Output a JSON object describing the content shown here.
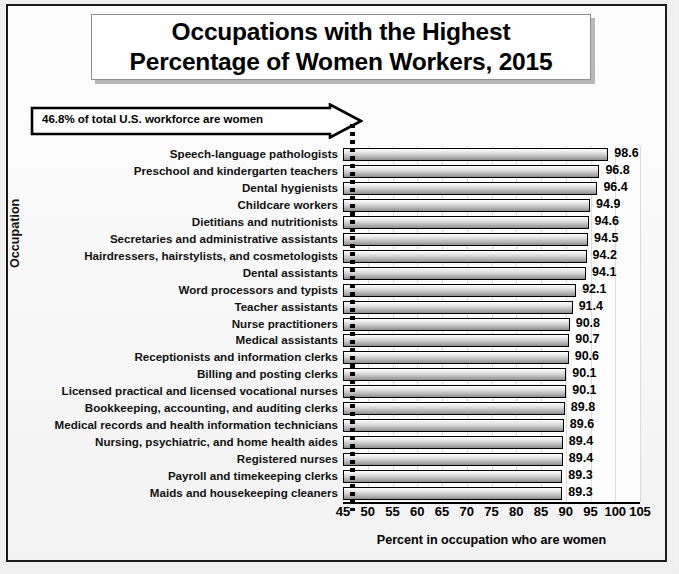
{
  "chart_data": {
    "type": "bar",
    "orientation": "horizontal",
    "title": "Occupations with the Highest Percentage of Women Workers, 2015",
    "title_lines": [
      "Occupations with the Highest",
      "Percentage of Women Workers, 2015"
    ],
    "xlabel": "Percent in occupation who are women",
    "ylabel": "Occupation",
    "xlim": [
      45,
      105
    ],
    "xticks": [
      45,
      50,
      55,
      60,
      65,
      70,
      75,
      80,
      85,
      90,
      95,
      100,
      105
    ],
    "grid": true,
    "grid_axis": "x",
    "legend": null,
    "annotation": {
      "text": "46.8% of total U.S. workforce are women",
      "reference_value": 46.8,
      "style": "block-arrow-callout-with-dotted-reference-line"
    },
    "categories": [
      "Speech-language pathologists",
      "Preschool and kindergarten teachers",
      "Dental hygienists",
      "Childcare workers",
      "Dietitians and nutritionists",
      "Secretaries and administrative assistants",
      "Hairdressers, hairstylists, and cosmetologists",
      "Dental assistants",
      "Word processors and typists",
      "Teacher assistants",
      "Nurse practitioners",
      "Medical assistants",
      "Receptionists and information clerks",
      "Billing and posting clerks",
      "Licensed practical and licensed vocational nurses",
      "Bookkeeping, accounting, and auditing clerks",
      "Medical records and health information technicians",
      "Nursing, psychiatric, and home health aides",
      "Registered nurses",
      "Payroll and timekeeping clerks",
      "Maids and housekeeping cleaners"
    ],
    "values": [
      98.6,
      96.8,
      96.4,
      94.9,
      94.6,
      94.5,
      94.2,
      94.1,
      92.1,
      91.4,
      90.8,
      90.7,
      90.6,
      90.1,
      90.1,
      89.8,
      89.6,
      89.4,
      89.4,
      89.3,
      89.3
    ],
    "value_labels": [
      "98.6",
      "96.8",
      "96.4",
      "94.9",
      "94.6",
      "94.5",
      "94.2",
      "94.1",
      "92.1",
      "91.4",
      "90.8",
      "90.7",
      "90.6",
      "90.1",
      "90.1",
      "89.8",
      "89.6",
      "89.4",
      "89.4",
      "89.3",
      "89.3"
    ]
  },
  "colors": {
    "bar_fill_top": "#ffffff",
    "bar_fill_bottom": "#8e8e8e",
    "bar_border": "#000000",
    "frame_border": "#1b1b1b",
    "plot_background": "#fdfdfd",
    "gridline": "#dcdcdc",
    "text": "#000000",
    "reference_line": "#000000"
  }
}
